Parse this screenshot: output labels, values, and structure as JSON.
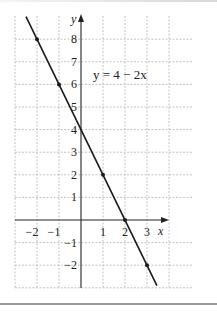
{
  "chart_data": {
    "type": "line",
    "title": "",
    "equation_label": "y = 4 − 2x",
    "xlabel": "x",
    "ylabel": "y",
    "xlim": [
      -3,
      5
    ],
    "ylim": [
      -3,
      9
    ],
    "grid": true,
    "x_ticks": [
      -2,
      -1,
      1,
      2,
      3
    ],
    "y_ticks": [
      -2,
      -1,
      1,
      2,
      3,
      4,
      5,
      6,
      7,
      8
    ],
    "x_tick_labels": [
      "−2",
      "−1",
      "1",
      "2",
      "3"
    ],
    "y_tick_labels": [
      "−2",
      "−1",
      "1",
      "2",
      "3",
      "4",
      "5",
      "6",
      "7",
      "8"
    ],
    "series": [
      {
        "name": "y = 4 − 2x",
        "slope": -2,
        "intercept": 4,
        "marked_points": [
          {
            "x": -2,
            "y": 8
          },
          {
            "x": -1,
            "y": 6
          },
          {
            "x": 1,
            "y": 2
          },
          {
            "x": 2,
            "y": 0
          },
          {
            "x": 3,
            "y": -2
          }
        ]
      }
    ]
  },
  "labels": {
    "x_axis": "x",
    "y_axis": "y",
    "equation": "y = 4 − 2x",
    "x_ticks": [
      "−2",
      "−1",
      "1",
      "2",
      "3"
    ],
    "y_ticks": [
      "8",
      "7",
      "6",
      "5",
      "4",
      "3",
      "2",
      "1",
      "−1",
      "−2"
    ]
  },
  "colors": {
    "line": "#1a1a1a",
    "grid": "#b0b0b0",
    "axis": "#222222"
  }
}
